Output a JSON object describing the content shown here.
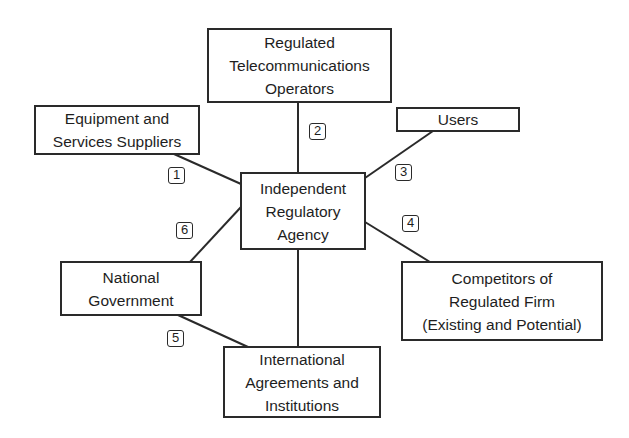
{
  "diagram": {
    "type": "stakeholder-network",
    "center": {
      "id": "agency",
      "lines": [
        "Independent",
        "Regulatory",
        "Agency"
      ]
    },
    "nodes": [
      {
        "id": "operators",
        "lines": [
          "Regulated",
          "Telecommunications",
          "Operators"
        ]
      },
      {
        "id": "suppliers",
        "lines": [
          "Equipment and",
          "Services Suppliers"
        ]
      },
      {
        "id": "users",
        "lines": [
          "Users"
        ]
      },
      {
        "id": "competitors",
        "lines": [
          "Competitors of",
          "Regulated Firm",
          "(Existing and Potential)"
        ]
      },
      {
        "id": "government",
        "lines": [
          "National",
          "Government"
        ]
      },
      {
        "id": "international",
        "lines": [
          "International",
          "Agreements and",
          "Institutions"
        ]
      }
    ],
    "links": [
      {
        "label": "1",
        "from": "suppliers",
        "to": "agency"
      },
      {
        "label": "2",
        "from": "operators",
        "to": "agency"
      },
      {
        "label": "3",
        "from": "users",
        "to": "agency"
      },
      {
        "label": "4",
        "from": "competitors",
        "to": "agency"
      },
      {
        "label": "5",
        "from": "government",
        "to": "international"
      },
      {
        "label": "6",
        "from": "government",
        "to": "agency"
      },
      {
        "label": "",
        "from": "agency",
        "to": "international"
      }
    ]
  }
}
